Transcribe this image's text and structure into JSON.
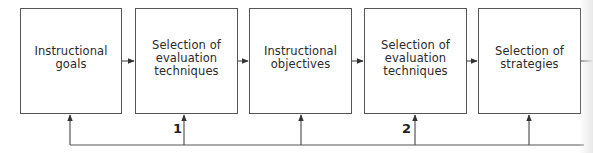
{
  "diagram": {
    "boxes": [
      {
        "lines": [
          "Instructional",
          "goals"
        ]
      },
      {
        "lines": [
          "Selection of",
          "evaluation",
          "techniques"
        ]
      },
      {
        "lines": [
          "Instructional",
          "objectives"
        ]
      },
      {
        "lines": [
          "Selection of",
          "evaluation",
          "techniques"
        ]
      },
      {
        "lines": [
          "Selection of",
          "strategies"
        ]
      }
    ],
    "feedback_labels": [
      "1",
      "2"
    ],
    "colors": {
      "line": "#555555",
      "text": "#2a2a2a",
      "background": "#ffffff"
    }
  }
}
